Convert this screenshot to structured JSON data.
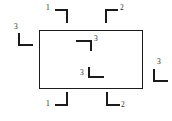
{
  "figure": {
    "type": "engineering-datum-target-diagram",
    "background_color": "#ffffff",
    "line_color": "#1b1b1b",
    "text_color": "#2a2a2a"
  },
  "shape": {
    "name": "main-rectangle",
    "x": 39,
    "y": 30,
    "width": 104,
    "height": 59
  },
  "markers": [
    {
      "id": "top-left-outside",
      "label": "1",
      "orientation": "top-right",
      "x": 55,
      "y": 9,
      "width": 13,
      "height": 14,
      "label_x": 46,
      "label_y": 4
    },
    {
      "id": "top-right-outside",
      "label": "2",
      "orientation": "top-left",
      "x": 105,
      "y": 9,
      "width": 13,
      "height": 14,
      "label_x": 120,
      "label_y": 4
    },
    {
      "id": "left-outside",
      "label": "3",
      "orientation": "bottom-left",
      "x": 18,
      "y": 33,
      "width": 15,
      "height": 13,
      "label_x": 14,
      "label_y": 23
    },
    {
      "id": "right-outside",
      "label": "3",
      "orientation": "bottom-left",
      "x": 153,
      "y": 69,
      "width": 15,
      "height": 13,
      "label_x": 157,
      "label_y": 58
    },
    {
      "id": "bottom-left-outside",
      "label": "1",
      "orientation": "bottom-right",
      "x": 55,
      "y": 92,
      "width": 13,
      "height": 14,
      "label_x": 46,
      "label_y": 100
    },
    {
      "id": "bottom-right-outside",
      "label": "2",
      "orientation": "bottom-left",
      "x": 106,
      "y": 92,
      "width": 14,
      "height": 14,
      "label_x": 121,
      "label_y": 101
    },
    {
      "id": "inner-upper",
      "label": "3",
      "orientation": "top-right",
      "x": 76,
      "y": 40,
      "width": 16,
      "height": 11,
      "label_x": 94,
      "label_y": 35
    },
    {
      "id": "inner-lower",
      "label": "3",
      "orientation": "bottom-left",
      "x": 88,
      "y": 67,
      "width": 16,
      "height": 11,
      "label_x": 80,
      "label_y": 69
    }
  ]
}
